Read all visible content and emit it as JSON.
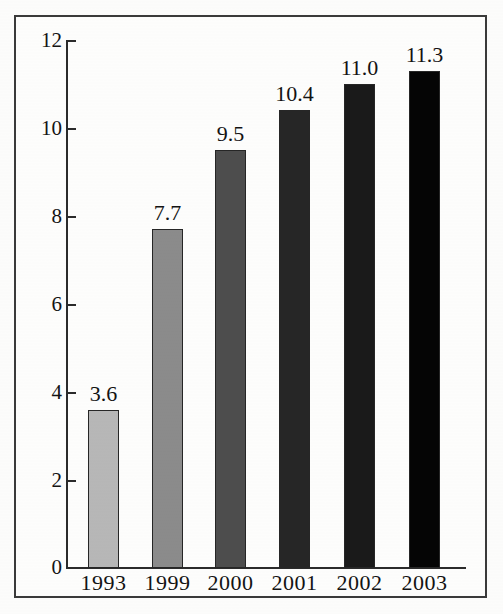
{
  "chart_data": {
    "type": "bar",
    "title": "",
    "subtitle": "",
    "xlabel": "",
    "ylabel": "",
    "categories": [
      "1993",
      "1999",
      "2000",
      "2001",
      "2002",
      "2003"
    ],
    "values": [
      3.6,
      7.7,
      9.5,
      10.4,
      11.0,
      11.3
    ],
    "data_labels": [
      "3.6",
      "7.7",
      "9.5",
      "10.4",
      "11.0",
      "11.3"
    ],
    "ylim": [
      0,
      12
    ],
    "y_ticks": [
      0,
      2,
      4,
      6,
      8,
      10,
      12
    ],
    "y_tick_labels": [
      "0",
      "2",
      "4",
      "6",
      "8",
      "10",
      "12"
    ],
    "grid": false,
    "legend": null,
    "legend_position": "none",
    "series": [
      {
        "name": "",
        "values": [
          3.6,
          7.7,
          9.5,
          10.4,
          11.0,
          11.3
        ]
      }
    ],
    "bar_colors": [
      "#b7b7b7",
      "#8b8b8b",
      "#4d4d4d",
      "#262626",
      "#1a1a1a",
      "#050505"
    ],
    "bar_edge_color": "#262626",
    "axis_color": "#2b2b2b",
    "frame_color": "#3a3a3a",
    "background_color": "#fdfdfc",
    "text_color": "#131313"
  },
  "axis": {
    "y_tick_labels": [
      "12",
      "10",
      "8",
      "6",
      "4",
      "2",
      "0"
    ],
    "x_tick_labels": [
      "1993",
      "1999",
      "2000",
      "2001",
      "2002",
      "2003"
    ]
  },
  "bars": [
    {
      "category": "1993",
      "label": "3.6",
      "value": 3.6,
      "color": "#b7b7b7"
    },
    {
      "category": "1999",
      "label": "7.7",
      "value": 7.7,
      "color": "#8b8b8b"
    },
    {
      "category": "2000",
      "label": "9.5",
      "value": 9.5,
      "color": "#4d4d4d"
    },
    {
      "category": "2001",
      "label": "10.4",
      "value": 10.4,
      "color": "#262626"
    },
    {
      "category": "2002",
      "label": "11.0",
      "value": 11.0,
      "color": "#1a1a1a"
    },
    {
      "category": "2003",
      "label": "11.3",
      "value": 11.3,
      "color": "#050505"
    }
  ]
}
